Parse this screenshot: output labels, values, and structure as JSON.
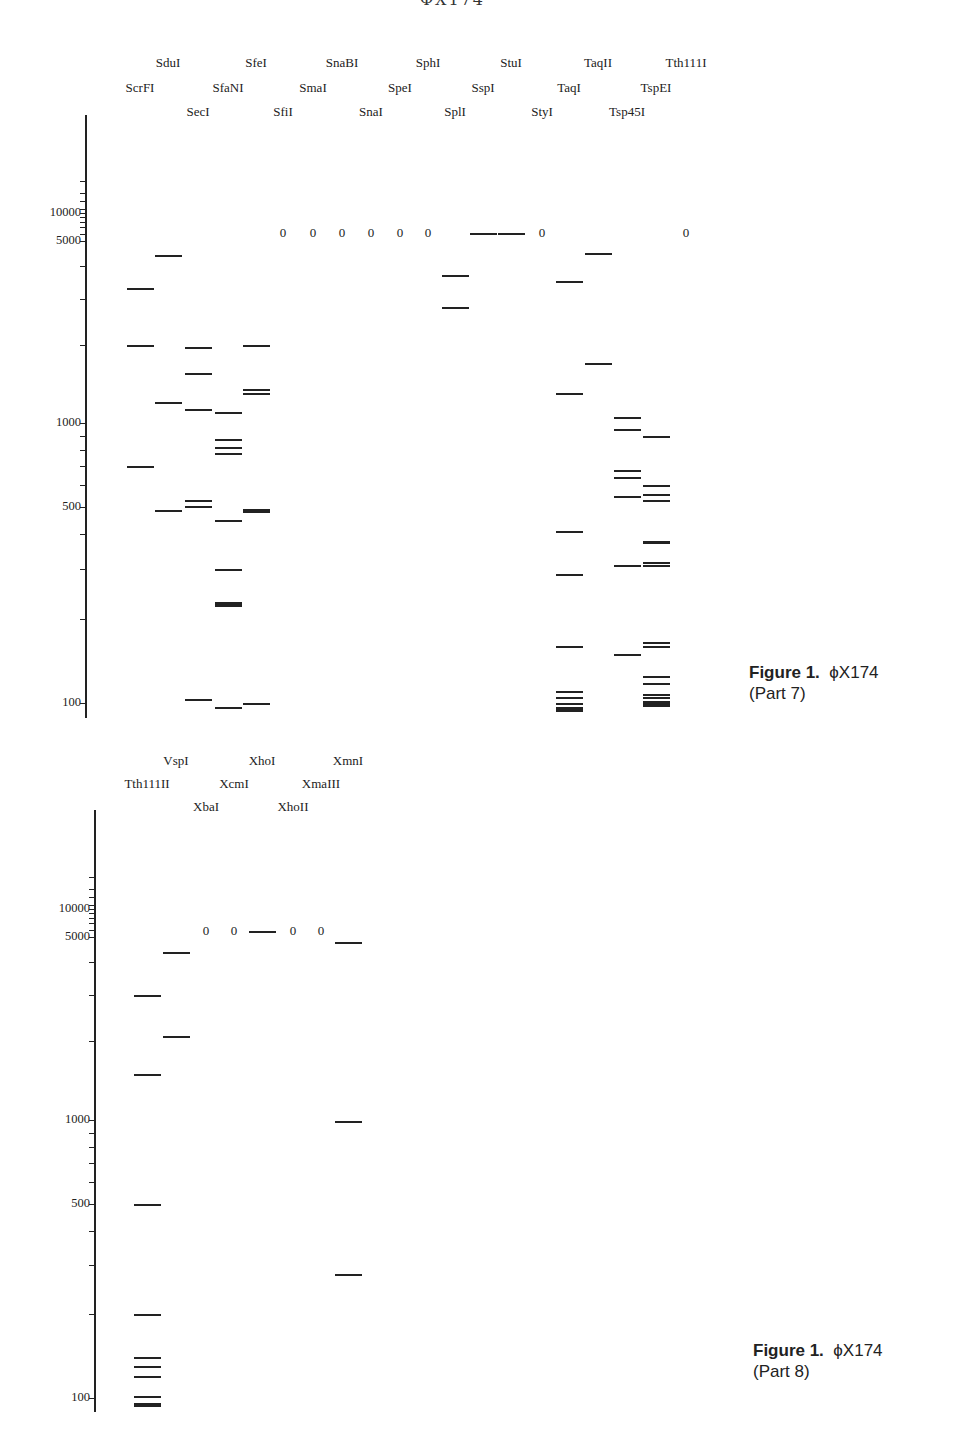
{
  "page": {
    "header_fragment": "ΦX174"
  },
  "chart_data": [
    {
      "type": "table",
      "title": "Figure 1. ΦX174 (Part 7)",
      "caption_bold": "Figure 1.",
      "caption_rest": "ϕX174",
      "caption_part": "(Part 7)",
      "ylabel": "Fragment size (bp)",
      "yscale": "log",
      "ylim": [
        90,
        20000
      ],
      "yticks": [
        100,
        500,
        1000,
        5000,
        10000
      ],
      "lanes": [
        {
          "enzyme": "ScrFI",
          "x": 140,
          "row": 1,
          "bands": [
            3300,
            2000,
            700
          ]
        },
        {
          "enzyme": "SduI",
          "x": 168,
          "row": 0,
          "bands": [
            4400,
            1200,
            490
          ]
        },
        {
          "enzyme": "SecI",
          "x": 198,
          "row": 2,
          "bands": [
            1950,
            1550,
            1130,
            530,
            505,
            103
          ]
        },
        {
          "enzyme": "SfaNI",
          "x": 228,
          "row": 1,
          "bands": [
            1100,
            880,
            820,
            780,
            450,
            300,
            230,
            225,
            97
          ]
        },
        {
          "enzyme": "SfeI",
          "x": 256,
          "row": 0,
          "bands": [
            2000,
            1350,
            1300,
            495,
            490,
            100
          ]
        },
        {
          "enzyme": "SfiI",
          "x": 283,
          "row": 2,
          "zero": true,
          "bands": []
        },
        {
          "enzyme": "SmaI",
          "x": 313,
          "row": 1,
          "zero": true,
          "bands": []
        },
        {
          "enzyme": "SnaBI",
          "x": 342,
          "row": 0,
          "zero": true,
          "bands": []
        },
        {
          "enzyme": "SnaI",
          "x": 371,
          "row": 2,
          "zero": true,
          "bands": []
        },
        {
          "enzyme": "SpeI",
          "x": 400,
          "row": 1,
          "zero": true,
          "bands": []
        },
        {
          "enzyme": "SphI",
          "x": 428,
          "row": 0,
          "zero": true,
          "bands": []
        },
        {
          "enzyme": "SplI",
          "x": 455,
          "row": 2,
          "bands": [
            3700,
            2800
          ]
        },
        {
          "enzyme": "SspI",
          "x": 483,
          "row": 1,
          "bands": [
            5386
          ]
        },
        {
          "enzyme": "StuI",
          "x": 511,
          "row": 0,
          "bands": [
            5386
          ]
        },
        {
          "enzyme": "StyI",
          "x": 542,
          "row": 2,
          "zero": true,
          "bands": []
        },
        {
          "enzyme": "TaqI",
          "x": 569,
          "row": 1,
          "bands": [
            3500,
            1300,
            410,
            290,
            160,
            110,
            105,
            100,
            97,
            95
          ]
        },
        {
          "enzyme": "TaqII",
          "x": 598,
          "row": 0,
          "bands": [
            4500,
            1700
          ]
        },
        {
          "enzyme": "Tsp45I",
          "x": 627,
          "row": 2,
          "bands": [
            1050,
            950,
            680,
            640,
            550,
            310,
            150
          ]
        },
        {
          "enzyme": "TspEI",
          "x": 656,
          "row": 1,
          "bands": [
            900,
            600,
            560,
            530,
            380,
            375,
            320,
            310,
            165,
            160,
            125,
            118,
            108,
            105,
            102,
            100,
            98
          ]
        },
        {
          "enzyme": "Tth111I",
          "x": 686,
          "row": 0,
          "zero": true,
          "bands": []
        }
      ]
    },
    {
      "type": "table",
      "title": "Figure 1. ΦX174 (Part 8)",
      "caption_bold": "Figure 1.",
      "caption_rest": "ϕX174",
      "caption_part": "(Part 8)",
      "ylabel": "Fragment size (bp)",
      "yscale": "log",
      "ylim": [
        90,
        20000
      ],
      "yticks": [
        100,
        500,
        1000,
        5000,
        10000
      ],
      "lanes": [
        {
          "enzyme": "Tth111II",
          "x": 147,
          "row": 1,
          "bands": [
            3000,
            1500,
            500,
            200,
            140,
            130,
            120,
            102,
            96,
            95
          ]
        },
        {
          "enzyme": "VspI",
          "x": 176,
          "row": 0,
          "bands": [
            4400,
            2100
          ]
        },
        {
          "enzyme": "XbaI",
          "x": 206,
          "row": 2,
          "zero": true,
          "bands": []
        },
        {
          "enzyme": "XcmI",
          "x": 234,
          "row": 1,
          "zero": true,
          "bands": []
        },
        {
          "enzyme": "XhoI",
          "x": 262,
          "row": 0,
          "bands": [
            5386
          ]
        },
        {
          "enzyme": "XhoII",
          "x": 293,
          "row": 2,
          "zero": true,
          "bands": []
        },
        {
          "enzyme": "XmaIII",
          "x": 321,
          "row": 1,
          "zero": true,
          "bands": []
        },
        {
          "enzyme": "XmnI",
          "x": 348,
          "row": 0,
          "bands": [
            4800,
            990,
            280
          ]
        }
      ]
    }
  ]
}
